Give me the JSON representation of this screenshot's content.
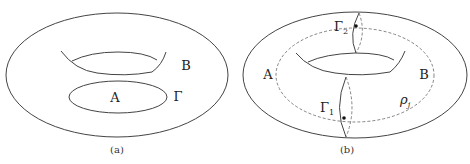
{
  "panels": [
    {
      "id": "a",
      "caption": "(a)",
      "labels": {
        "region_a": "A",
        "region_b": "B",
        "curve": "Γ"
      }
    },
    {
      "id": "b",
      "caption": "(b)",
      "labels": {
        "region_a": "A",
        "region_b": "B",
        "gamma1": "Γ",
        "gamma1_sub": "1",
        "gamma2": "Γ",
        "gamma2_sub": "2",
        "rho": "ρ",
        "rho_sub": "j"
      }
    }
  ],
  "colors": {
    "stroke": "#444444",
    "dashed": "#666666",
    "text": "#222222"
  }
}
